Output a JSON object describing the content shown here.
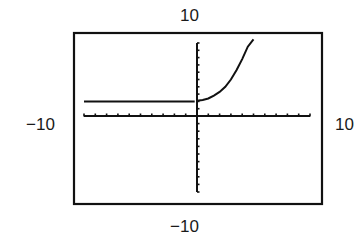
{
  "chart_data": {
    "type": "line",
    "title": "",
    "xlabel": "",
    "ylabel": "",
    "window": {
      "xmin": -10,
      "xmax": 10,
      "ymin": -10,
      "ymax": 10,
      "xscl": 1,
      "yscl": 1
    },
    "window_labels": {
      "top": "10",
      "bottom": "−10",
      "left": "−10",
      "right": "10"
    },
    "grid": false,
    "series": [
      {
        "name": "piecewise",
        "segments": [
          {
            "x": [
              -10,
              -0.2
            ],
            "y": [
              2,
              2
            ]
          },
          {
            "x": [
              0,
              0.5,
              1,
              1.5,
              2,
              2.5,
              3,
              3.5,
              4,
              4.5,
              5
            ],
            "y": [
              2.1,
              2.2,
              2.4,
              2.8,
              3.3,
              4.0,
              5.0,
              6.3,
              7.8,
              9.5,
              11
            ]
          }
        ]
      }
    ]
  },
  "labels": {
    "top": "10",
    "bottom": "−10",
    "left": "−10",
    "right": "10"
  },
  "colors": {
    "ink": "#111111",
    "background": "#ffffff"
  }
}
